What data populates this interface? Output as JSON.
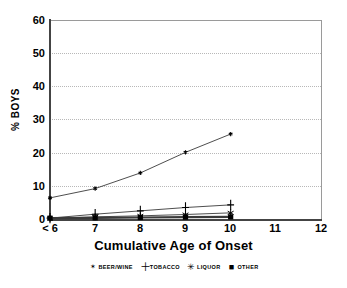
{
  "chart_data": {
    "type": "line",
    "title": "Cumulative Age of Onset",
    "xlabel": "Cumulative Age of Onset",
    "ylabel": "% BOYS",
    "x_tick_labels": [
      "< 6",
      "7",
      "8",
      "9",
      "10",
      "11",
      "12"
    ],
    "x_tick_values": [
      6,
      7,
      8,
      9,
      10,
      11,
      12
    ],
    "y_tick_labels": [
      "0",
      "10",
      "20",
      "30",
      "40",
      "50",
      "60"
    ],
    "y_tick_values": [
      0,
      10,
      20,
      30,
      40,
      50,
      60
    ],
    "xlim": [
      6,
      12
    ],
    "ylim": [
      0,
      60
    ],
    "grid": "horizontal-dotted",
    "legend_position": "below-plot",
    "categories": [
      "< 6",
      "7",
      "8",
      "9",
      "10"
    ],
    "x": [
      6,
      7,
      8,
      9,
      10
    ],
    "series": [
      {
        "name": "BEER/WINE",
        "marker": "star",
        "marker_glyph": "✶",
        "values": [
          6.5,
          9.3,
          14.0,
          20.2,
          25.7
        ]
      },
      {
        "name": "TOBACCO",
        "marker": "plus",
        "marker_glyph": "＋",
        "values": [
          0.4,
          1.6,
          2.6,
          3.6,
          4.4
        ]
      },
      {
        "name": "LIQUOR",
        "marker": "asterisk",
        "marker_glyph": "✳",
        "values": [
          0.3,
          0.8,
          1.1,
          1.5,
          2.0
        ]
      },
      {
        "name": "OTHER",
        "marker": "square",
        "marker_glyph": "■",
        "values": [
          0.4,
          0.5,
          0.6,
          0.7,
          0.8
        ]
      }
    ]
  },
  "axes": {
    "y_label": "% BOYS",
    "x_title": "Cumulative Age of Onset",
    "y_ticks": [
      "60",
      "50",
      "40",
      "30",
      "20",
      "10",
      "0"
    ],
    "x_ticks": [
      "< 6",
      "7",
      "8",
      "9",
      "10",
      "11",
      "12"
    ]
  },
  "legend": {
    "items": [
      {
        "label": "BEER/WINE",
        "marker": "star-marker-icon",
        "glyph": "✶"
      },
      {
        "label": "TOBACCO",
        "marker": "plus-marker-icon",
        "glyph": "＋"
      },
      {
        "label": "LIQUOR",
        "marker": "asterisk-marker-icon",
        "glyph": "✳"
      },
      {
        "label": "OTHER",
        "marker": "square-marker-icon",
        "glyph": "■"
      }
    ]
  },
  "colors": {
    "axis": "#444444",
    "grid": "#b8b8b8",
    "series_line": "#3a3a3a",
    "background": "#ffffff"
  }
}
